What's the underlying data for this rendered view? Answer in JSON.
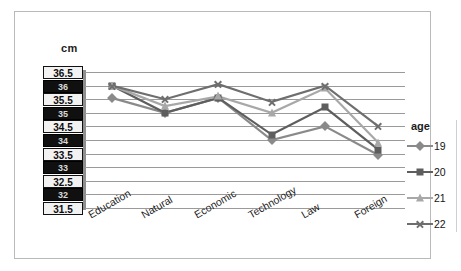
{
  "chart_data": {
    "type": "line",
    "title": "",
    "xlabel": "",
    "ylabel": "cm",
    "ylim": [
      31.5,
      36.5
    ],
    "ytick_step": 0.5,
    "grid": true,
    "legend_position": "right",
    "legend_title": "age",
    "categories": [
      "Education",
      "Natural",
      "Economic",
      "Technology",
      "Law",
      "Foreign"
    ],
    "ytick_labels": [
      "36.5",
      "36",
      "35.5",
      "35",
      "34.5",
      "34",
      "33.5",
      "33",
      "32.5",
      "32",
      "31.5"
    ],
    "series": [
      {
        "name": "19",
        "marker": "diamond",
        "color": "#8a8a8a",
        "values": [
          35.55,
          35.0,
          35.55,
          34.0,
          34.5,
          33.45
        ]
      },
      {
        "name": "20",
        "marker": "square",
        "color": "#5e5e5e",
        "values": [
          36.0,
          35.0,
          35.55,
          34.2,
          35.2,
          33.65
        ]
      },
      {
        "name": "21",
        "marker": "triangle",
        "color": "#a8a8a8",
        "values": [
          36.0,
          35.25,
          35.6,
          35.0,
          35.9,
          33.9
        ]
      },
      {
        "name": "22",
        "marker": "x",
        "color": "#6e6e6e",
        "values": [
          36.0,
          35.5,
          36.05,
          35.4,
          36.0,
          34.5
        ]
      }
    ]
  },
  "axis": {
    "unit_label": "cm"
  },
  "legend": {
    "title": "age",
    "items": [
      {
        "label": "19",
        "marker": "diamond-marker-icon"
      },
      {
        "label": "20",
        "marker": "square-marker-icon"
      },
      {
        "label": "21",
        "marker": "triangle-marker-icon"
      },
      {
        "label": "22",
        "marker": "x-marker-icon"
      }
    ]
  },
  "colors": {
    "gridline": "#9a9a9a",
    "frame_border": "#b9b9b9",
    "axis": "#8f8f8f"
  }
}
